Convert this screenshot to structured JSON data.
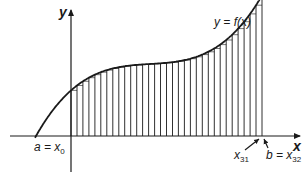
{
  "diagram": {
    "axes": {
      "x_label": "x",
      "y_label": "y"
    },
    "curve_label": "y = f(x)",
    "labels": {
      "a_prefix": "a = x",
      "a_sub": "0",
      "x31_prefix": "x",
      "x31_sub": "31",
      "b_prefix": "b = x",
      "b_sub": "32"
    },
    "subintervals": 32,
    "colors": {
      "ink": "#1a1a1a",
      "background": "#ffffff"
    }
  }
}
